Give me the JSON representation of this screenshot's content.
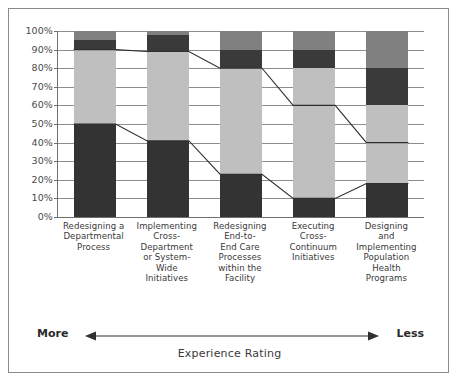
{
  "chart_data": {
    "type": "bar",
    "subtype": "100% stacked bar with trend lines",
    "title": "",
    "xlabel": "Experience Rating",
    "ylabel": "",
    "ylim": [
      0,
      100
    ],
    "grid": true,
    "legend": "none",
    "categories": [
      "Redesigning a Departmental Process",
      "Implementing Cross-Department or System-Wide Initiatives",
      "Redesigning End-to-End Care Processes within the Facility",
      "Executing Cross-Continuum Initiatives",
      "Designing and Implementing Population Health Programs"
    ],
    "category_lines": [
      [
        "Redesigning a",
        "Departmental",
        "Process"
      ],
      [
        "Implementing",
        "Cross-",
        "Department",
        "or System-",
        "Wide",
        "Initiatives"
      ],
      [
        "Redesigning",
        "End-to-",
        "End Care",
        "Processes",
        "within the",
        "Facility"
      ],
      [
        "Executing",
        "Cross-",
        "Continuum",
        "Initiatives"
      ],
      [
        "Designing",
        "and",
        "Implementing",
        "Population",
        "Health",
        "Programs"
      ]
    ],
    "series": [
      {
        "name": "segment-1-bottom",
        "color": "#333333",
        "values": [
          50,
          41,
          23,
          10,
          18
        ]
      },
      {
        "name": "segment-2",
        "color": "#bfbfbf",
        "values": [
          40,
          48,
          57,
          70,
          42
        ]
      },
      {
        "name": "segment-3",
        "color": "#3a3a3a",
        "values": [
          5,
          9,
          10,
          10,
          20
        ]
      },
      {
        "name": "segment-4-top",
        "color": "#808080",
        "values": [
          5,
          2,
          10,
          10,
          20
        ]
      }
    ],
    "trend_lines": [
      {
        "name": "upper-cumulative-line",
        "values": [
          90,
          89,
          80,
          60,
          40
        ]
      },
      {
        "name": "lower-cumulative-line",
        "values": [
          50,
          41,
          23,
          10,
          18
        ]
      }
    ],
    "y_ticks": [
      "0%",
      "10%",
      "20%",
      "30%",
      "40%",
      "50%",
      "60%",
      "70%",
      "80%",
      "90%",
      "100%"
    ],
    "y_tick_values": [
      0,
      10,
      20,
      30,
      40,
      50,
      60,
      70,
      80,
      90,
      100
    ]
  },
  "axis": {
    "more_label": "More",
    "less_label": "Less",
    "caption": "Experience Rating"
  },
  "colors": {
    "dark": "#333333",
    "dark_alt": "#3a3a3a",
    "light_gray": "#bfbfbf",
    "medium_gray": "#808080",
    "grid": "#8d8d8d",
    "frame": "#8a8a8a",
    "line": "#2f2f2f"
  }
}
